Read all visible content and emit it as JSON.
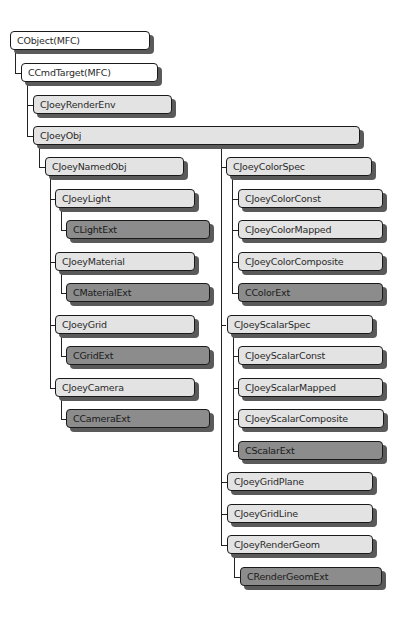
{
  "diagram": {
    "colors": {
      "mfc": "#ffffff",
      "joey": "#e3e3e3",
      "ext": "#8c8c8c",
      "shadow": "#5a5a5a",
      "line": "#222222"
    },
    "nodes": [
      {
        "id": "CObject",
        "label": "CObject(MFC)",
        "kind": "mfc",
        "parent": null
      },
      {
        "id": "CCmdTarget",
        "label": "CCmdTarget(MFC)",
        "kind": "mfc",
        "parent": "CObject"
      },
      {
        "id": "CJoeyRenderEnv",
        "label": "CJoeyRenderEnv",
        "kind": "joey",
        "parent": "CCmdTarget"
      },
      {
        "id": "CJoeyObj",
        "label": "CJoeyObj",
        "kind": "joey",
        "parent": "CCmdTarget"
      },
      {
        "id": "CJoeyNamedObj",
        "label": "CJoeyNamedObj",
        "kind": "joey",
        "parent": "CJoeyObj"
      },
      {
        "id": "CJoeyLight",
        "label": "CJoeyLight",
        "kind": "joey",
        "parent": "CJoeyNamedObj"
      },
      {
        "id": "CLightExt",
        "label": "CLightExt",
        "kind": "ext",
        "parent": "CJoeyLight"
      },
      {
        "id": "CJoeyMaterial",
        "label": "CJoeyMaterial",
        "kind": "joey",
        "parent": "CJoeyNamedObj"
      },
      {
        "id": "CMaterialExt",
        "label": "CMaterialExt",
        "kind": "ext",
        "parent": "CJoeyMaterial"
      },
      {
        "id": "CJoeyGrid",
        "label": "CJoeyGrid",
        "kind": "joey",
        "parent": "CJoeyNamedObj"
      },
      {
        "id": "CGridExt",
        "label": "CGridExt",
        "kind": "ext",
        "parent": "CJoeyGrid"
      },
      {
        "id": "CJoeyCamera",
        "label": "CJoeyCamera",
        "kind": "joey",
        "parent": "CJoeyNamedObj"
      },
      {
        "id": "CCameraExt",
        "label": "CCameraExt",
        "kind": "ext",
        "parent": "CJoeyCamera"
      },
      {
        "id": "CJoeyColorSpec",
        "label": "CJoeyColorSpec",
        "kind": "joey",
        "parent": "CJoeyObj"
      },
      {
        "id": "CJoeyColorConst",
        "label": "CJoeyColorConst",
        "kind": "joey",
        "parent": "CJoeyColorSpec"
      },
      {
        "id": "CJoeyColorMapped",
        "label": "CJoeyColorMapped",
        "kind": "joey",
        "parent": "CJoeyColorSpec"
      },
      {
        "id": "CJoeyColorComposite",
        "label": "CJoeyColorComposite",
        "kind": "joey",
        "parent": "CJoeyColorSpec"
      },
      {
        "id": "CColorExt",
        "label": "CColorExt",
        "kind": "ext",
        "parent": "CJoeyColorSpec"
      },
      {
        "id": "CJoeyScalarSpec",
        "label": "CJoeyScalarSpec",
        "kind": "joey",
        "parent": "CJoeyObj"
      },
      {
        "id": "CJoeyScalarConst",
        "label": "CJoeyScalarConst",
        "kind": "joey",
        "parent": "CJoeyScalarSpec"
      },
      {
        "id": "CJoeyScalarMapped",
        "label": "CJoeyScalarMapped",
        "kind": "joey",
        "parent": "CJoeyScalarSpec"
      },
      {
        "id": "CJoeyScalarComposite",
        "label": "CJoeyScalarComposite",
        "kind": "joey",
        "parent": "CJoeyScalarSpec"
      },
      {
        "id": "CScalarExt",
        "label": "CScalarExt",
        "kind": "ext",
        "parent": "CJoeyScalarSpec"
      },
      {
        "id": "CJoeyGridPlane",
        "label": "CJoeyGridPlane",
        "kind": "joey",
        "parent": "CJoeyObj"
      },
      {
        "id": "CJoeyGridLine",
        "label": "CJoeyGridLine",
        "kind": "joey",
        "parent": "CJoeyObj"
      },
      {
        "id": "CJoeyRenderGeom",
        "label": "CJoeyRenderGeom",
        "kind": "joey",
        "parent": "CJoeyObj"
      },
      {
        "id": "CRenderGeomExt",
        "label": "CRenderGeomExt",
        "kind": "ext",
        "parent": "CJoeyRenderGeom"
      }
    ]
  }
}
